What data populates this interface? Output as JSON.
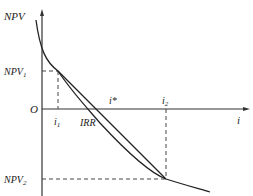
{
  "diagram": {
    "labels": {
      "y_axis": "NPV",
      "x_axis": "i",
      "origin": "O",
      "npv1": "NPV",
      "npv1_sub": "1",
      "npv2": "NPV",
      "npv2_sub": "2",
      "i1": "i",
      "i1_sub": "1",
      "i2": "i",
      "i2_sub": "2",
      "irr": "IRR",
      "istar": "i*"
    },
    "colors": {
      "line": "#222222",
      "dash": "#444444"
    }
  }
}
